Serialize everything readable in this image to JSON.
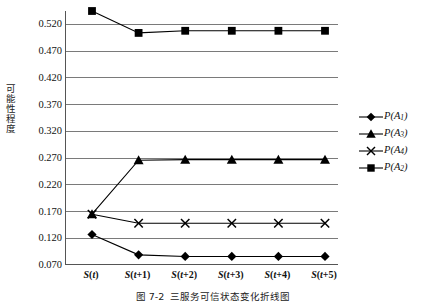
{
  "figure": {
    "y_axis_title": "可能性程度",
    "caption_number": "图 7-2",
    "caption_text": "三服务可信状态变化折线图"
  },
  "chart_data": {
    "type": "line",
    "title": "",
    "xlabel": "",
    "ylabel": "可能性程度",
    "x": [
      "S(t)",
      "S(t+1)",
      "S(t+2)",
      "S(t+3)",
      "S(t+4)",
      "S(t+5)"
    ],
    "x_tick_labels": [
      {
        "base": "S",
        "arg": "t"
      },
      {
        "base": "S",
        "arg": "t+1"
      },
      {
        "base": "S",
        "arg": "t+2"
      },
      {
        "base": "S",
        "arg": "t+3"
      },
      {
        "base": "S",
        "arg": "t+4"
      },
      {
        "base": "S",
        "arg": "t+5"
      }
    ],
    "y_ticks": [
      0.07,
      0.12,
      0.17,
      0.22,
      0.27,
      0.32,
      0.37,
      0.42,
      0.47,
      0.52
    ],
    "y_tick_labels": [
      "0.070",
      "0.120",
      "0.170",
      "0.220",
      "0.270",
      "0.320",
      "0.370",
      "0.420",
      "0.470",
      "0.520"
    ],
    "ylim": [
      0.07,
      0.545
    ],
    "grid": true,
    "legend_position": "right",
    "series": [
      {
        "name": "P(A1)",
        "label_base": "P(A",
        "label_sub": "1",
        "marker": "diamond",
        "color": "#000000",
        "values": [
          0.127,
          0.089,
          0.086,
          0.086,
          0.086,
          0.086
        ]
      },
      {
        "name": "P(A3)",
        "label_base": "P(A",
        "label_sub": "3",
        "marker": "triangle",
        "color": "#000000",
        "values": [
          0.165,
          0.266,
          0.267,
          0.267,
          0.267,
          0.267
        ]
      },
      {
        "name": "P(A4)",
        "label_base": "P(A",
        "label_sub": "4",
        "marker": "cross",
        "color": "#000000",
        "values": [
          0.165,
          0.148,
          0.148,
          0.148,
          0.148,
          0.148
        ]
      },
      {
        "name": "P(A2)",
        "label_base": "P(A",
        "label_sub": "2",
        "marker": "square",
        "color": "#000000",
        "values": [
          0.545,
          0.504,
          0.508,
          0.508,
          0.508,
          0.508
        ]
      }
    ]
  }
}
